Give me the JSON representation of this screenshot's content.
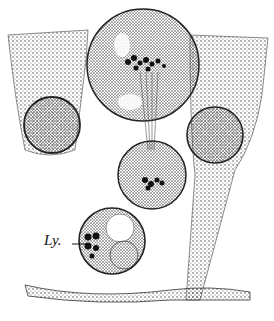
{
  "figure": {
    "labels": [
      {
        "id": "ly",
        "text": "Ly.",
        "x": 44,
        "y": 230
      }
    ],
    "colors": {
      "ink": "#1a1a1a",
      "paper": "#ffffff",
      "stipple": "#555555"
    }
  }
}
